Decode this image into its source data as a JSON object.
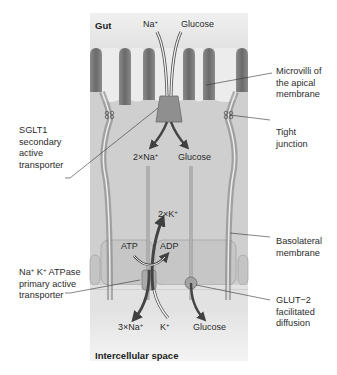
{
  "regions": {
    "top": "Gut",
    "bottom": "Intercellular space"
  },
  "apical_inputs": {
    "sodium": "Na",
    "sodium_charge": "+",
    "glucose": "Glucose"
  },
  "intracellular": {
    "sodium": "2×Na",
    "sodium_charge": "+",
    "glucose": "Glucose",
    "potassium_in": "2×K",
    "potassium_charge": "+",
    "atp": "ATP",
    "adp": "ADP"
  },
  "basolateral_outputs": {
    "sodium": "3×Na",
    "sodium_charge": "+",
    "potassium": "K",
    "potassium_charge": "+",
    "glucose": "Glucose"
  },
  "callouts": {
    "left": [
      {
        "id": "sglt1",
        "lines": [
          "SGLT1",
          "secondary",
          "active",
          "transporter"
        ]
      },
      {
        "id": "nak-atpase",
        "first_line_parts": [
          "Na",
          "+",
          " K",
          "+",
          " ATPase"
        ],
        "lines": [
          "primary active",
          "transporter"
        ]
      }
    ],
    "right": [
      {
        "id": "microvilli",
        "lines": [
          "Microvilli of",
          "the apical",
          "membrane"
        ]
      },
      {
        "id": "tight-junction",
        "lines": [
          "Tight",
          "junction"
        ]
      },
      {
        "id": "basolateral",
        "lines": [
          "Basolateral",
          "membrane"
        ]
      },
      {
        "id": "glut2",
        "lines": [
          "GLUT−2",
          "facilitated",
          "diffusion"
        ]
      }
    ]
  },
  "colors": {
    "background_panel": "#e3e3e3",
    "cell_fill": "#c9c9c9",
    "membrane_dark": "#6d6d6d",
    "arrow_dark": "#4a4a4a",
    "text": "#2b2b2b"
  }
}
